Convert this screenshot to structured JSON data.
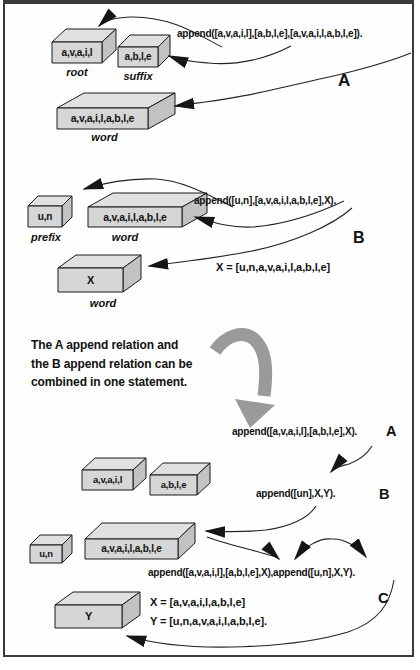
{
  "colors": {
    "box_front": "#d6d6d6",
    "box_top": "#e0e0e0",
    "box_side": "#c2c2c2",
    "outline": "#1a1a1a",
    "arrow": "#222222",
    "swoosh": "#9a9a9a"
  },
  "section_a": {
    "statement": "append([a,v,a,i,l],[a,b,l,e],[a,v,a,i,l,a,b,l,e]).",
    "label": "A",
    "boxes": {
      "root": {
        "content": "a,v,a,i,l",
        "caption": "root"
      },
      "suffix": {
        "content": "a,b,l,e",
        "caption": "suffix"
      },
      "word": {
        "content": "a,v,a,i,l,a,b,l,e",
        "caption": "word"
      }
    }
  },
  "section_b": {
    "statement": "append([u,n],[a,v,a,i,l,a,b,l,e],X).",
    "result": "X = [u,n,a,v,a,i,l,a,b,l,e]",
    "label": "B",
    "boxes": {
      "prefix": {
        "content": "u,n",
        "caption": "prefix"
      },
      "word": {
        "content": "a,v,a,i,l,a,b,l,e",
        "caption": "word"
      },
      "x": {
        "content": "X",
        "caption": "word"
      }
    }
  },
  "note": {
    "line1": "The A append relation and",
    "line2": "the B append relation can be",
    "line3": "combined in one statement."
  },
  "section_c": {
    "statement_a": "append([a,v,a,i,l],[a,b,l,e],X).",
    "label_a": "A",
    "statement_b": "append([un],X,Y).",
    "label_b": "B",
    "statement_combined": "append([a,v,a,i,l],[a,b,l,e],X),append([u,n],X,Y).",
    "label_c": "C",
    "result_x": "X = [a,v,a,i,l,a,b,l,e]",
    "result_y": "Y = [u,n,a,v,a,i,l,a,b,l,e].",
    "boxes": {
      "avail": {
        "content": "a,v,a,i,l"
      },
      "able": {
        "content": "a,b,l,e"
      },
      "un": {
        "content": "u,n"
      },
      "word": {
        "content": "a,v,a,i,l,a,b,l,e"
      },
      "y": {
        "content": "Y"
      }
    }
  }
}
